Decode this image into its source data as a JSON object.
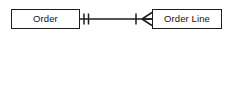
{
  "diagram": {
    "type": "entity-relationship",
    "notation": "crow's foot",
    "background_color": "#ffffff",
    "line_color": "#1c1c1c",
    "text_color": "#121212",
    "entities": [
      {
        "id": "order",
        "label": "Order",
        "x": 11,
        "y": 9,
        "width": 69,
        "height": 20
      },
      {
        "id": "order-line",
        "label": "Order Line",
        "x": 152,
        "y": 9,
        "width": 70,
        "height": 20
      }
    ],
    "relationship": {
      "from": "Order",
      "to": "Order Line",
      "from_cardinality": "one and only one",
      "from_symbol": "double-bar",
      "to_cardinality": "one or many",
      "to_symbol": "bar-crowsfoot",
      "line_y": 19,
      "line_start_x": 80,
      "line_end_x": 152
    }
  }
}
